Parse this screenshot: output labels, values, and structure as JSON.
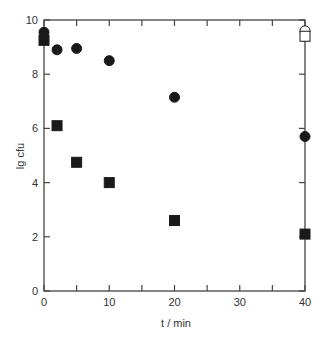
{
  "chart_data": {
    "type": "scatter",
    "title": "",
    "xlabel": "t / min",
    "ylabel": "lg cfu",
    "xlim": [
      0,
      40
    ],
    "ylim": [
      0,
      10
    ],
    "x_ticks": [
      0,
      10,
      20,
      30,
      40
    ],
    "x_minor_ticks": [
      5,
      15,
      25,
      35
    ],
    "y_ticks": [
      0,
      2,
      4,
      6,
      8,
      10
    ],
    "grid": false,
    "legend": null,
    "series": [
      {
        "name": "filled circles",
        "marker": "circle",
        "filled": true,
        "color": "#1a1a1a",
        "x": [
          0,
          2,
          5,
          10,
          20,
          40
        ],
        "y": [
          9.55,
          8.9,
          8.95,
          8.5,
          7.15,
          5.7
        ]
      },
      {
        "name": "filled squares",
        "marker": "square",
        "filled": true,
        "color": "#1a1a1a",
        "x": [
          0,
          2,
          5,
          10,
          20,
          40
        ],
        "y": [
          9.25,
          6.1,
          4.75,
          4.0,
          2.6,
          2.1
        ]
      },
      {
        "name": "open circles",
        "marker": "circle",
        "filled": false,
        "color": "#1a1a1a",
        "x": [
          40
        ],
        "y": [
          9.6
        ]
      },
      {
        "name": "open squares",
        "marker": "square",
        "filled": false,
        "color": "#1a1a1a",
        "x": [
          40
        ],
        "y": [
          9.4
        ]
      }
    ]
  }
}
